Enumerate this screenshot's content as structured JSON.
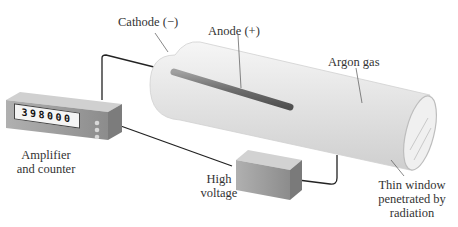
{
  "diagram": {
    "labels": {
      "cathode": "Cathode (−)",
      "anode": "Anode (+)",
      "argon": "Argon gas",
      "amplifier_line1": "Amplifier",
      "amplifier_line2": "and counter",
      "high_voltage_line1": "High",
      "high_voltage_line2": "voltage",
      "window_line1": "Thin window",
      "window_line2": "penetrated by",
      "window_line3": "radiation"
    },
    "counter_display": "398000",
    "components": [
      "amplifier-counter",
      "high-voltage-supply",
      "tube",
      "cathode-rod",
      "window"
    ],
    "colors": {
      "wire": "#222222",
      "box": "#9a9a9a",
      "tube": "#e6e6e6",
      "rod": "#7a7a7a"
    }
  }
}
